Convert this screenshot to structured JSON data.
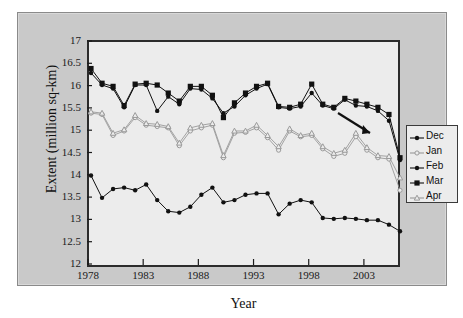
{
  "figure": {
    "background": "#ffffff",
    "panel_color": "#c9c9c9",
    "plot_background": "#ececec",
    "dark_series_color": "#111111",
    "light_series_color": "#9a9a9a"
  },
  "chart_data": {
    "type": "line",
    "title": "",
    "xlabel": "Year",
    "ylabel": "Extent (million sq-km)",
    "xlim": [
      1978,
      2006
    ],
    "ylim": [
      12,
      17
    ],
    "ytick_values": [
      17,
      16.5,
      16,
      15.5,
      15,
      14.5,
      14,
      13.5,
      13,
      12.5,
      12
    ],
    "ytick_labels": [
      "17",
      "16.5",
      "16",
      "15.5",
      "15",
      "14.5",
      "14",
      "13.5",
      "13",
      "12.5",
      "12"
    ],
    "xtick_values": [
      1978,
      1983,
      1988,
      1993,
      1998,
      2003
    ],
    "xtick_labels": [
      "1978",
      "1983",
      "1988",
      "1993",
      "1998",
      "2003"
    ],
    "grid": false,
    "legend_position": "right-outside",
    "x": [
      1978,
      1979,
      1980,
      1981,
      1982,
      1983,
      1984,
      1985,
      1986,
      1987,
      1988,
      1989,
      1990,
      1991,
      1992,
      1993,
      1994,
      1995,
      1996,
      1997,
      1998,
      1999,
      2000,
      2001,
      2002,
      2003,
      2004,
      2005,
      2006
    ],
    "series": [
      {
        "name": "Dec",
        "marker": "filled-circle",
        "color": "#111111",
        "values": [
          14.05,
          13.55,
          13.75,
          13.78,
          13.72,
          13.85,
          13.5,
          13.25,
          13.22,
          13.35,
          13.62,
          13.78,
          13.45,
          13.5,
          13.62,
          13.65,
          13.65,
          13.18,
          13.42,
          13.5,
          13.45,
          13.1,
          13.08,
          13.1,
          13.08,
          13.05,
          13.05,
          12.95,
          12.8
        ]
      },
      {
        "name": "Jan",
        "marker": "open-circle",
        "color": "#9a9a9a",
        "values": [
          15.45,
          15.42,
          14.95,
          15.05,
          15.35,
          15.18,
          15.15,
          15.12,
          14.72,
          15.05,
          15.12,
          15.18,
          14.45,
          15.0,
          15.02,
          15.12,
          14.9,
          14.62,
          15.05,
          14.92,
          14.95,
          14.65,
          14.48,
          14.55,
          14.92,
          14.62,
          14.45,
          14.42,
          13.72
        ]
      },
      {
        "name": "Feb",
        "marker": "filled-circle",
        "color": "#111111",
        "values": [
          16.35,
          16.08,
          16.0,
          15.58,
          16.08,
          16.08,
          15.5,
          15.82,
          15.65,
          16.0,
          15.98,
          15.78,
          15.45,
          15.6,
          15.85,
          16.0,
          16.1,
          15.58,
          15.55,
          15.6,
          15.9,
          15.62,
          15.55,
          15.75,
          15.62,
          15.6,
          15.5,
          15.28,
          14.4
        ]
      },
      {
        "name": "Mar",
        "marker": "filled-square",
        "color": "#111111",
        "values": [
          16.45,
          16.12,
          16.05,
          15.62,
          16.1,
          16.12,
          16.08,
          15.9,
          15.72,
          16.05,
          16.05,
          15.85,
          15.35,
          15.68,
          15.9,
          16.05,
          16.12,
          15.6,
          15.58,
          15.65,
          16.1,
          15.65,
          15.58,
          15.78,
          15.72,
          15.65,
          15.58,
          15.42,
          14.45
        ]
      },
      {
        "name": "Apr",
        "marker": "open-triangle",
        "color": "#9a9a9a",
        "values": [
          15.48,
          15.45,
          15.0,
          15.08,
          15.4,
          15.22,
          15.2,
          15.15,
          14.78,
          15.12,
          15.18,
          15.22,
          14.5,
          15.05,
          15.05,
          15.18,
          14.95,
          14.7,
          15.1,
          14.95,
          15.0,
          14.7,
          14.55,
          14.62,
          15.0,
          14.68,
          14.5,
          14.48,
          14.0
        ]
      }
    ],
    "annotation": {
      "type": "arrow",
      "note": "arrow from legend area pointing down-left to final data points"
    }
  },
  "legend": {
    "entries": [
      {
        "label": "Dec",
        "marker": "filled-circle",
        "color": "#111111"
      },
      {
        "label": "Jan",
        "marker": "open-circle",
        "color": "#9a9a9a"
      },
      {
        "label": "Feb",
        "marker": "filled-circle",
        "color": "#111111"
      },
      {
        "label": "Mar",
        "marker": "filled-square",
        "color": "#111111"
      },
      {
        "label": "Apr",
        "marker": "open-triangle",
        "color": "#9a9a9a"
      }
    ]
  }
}
